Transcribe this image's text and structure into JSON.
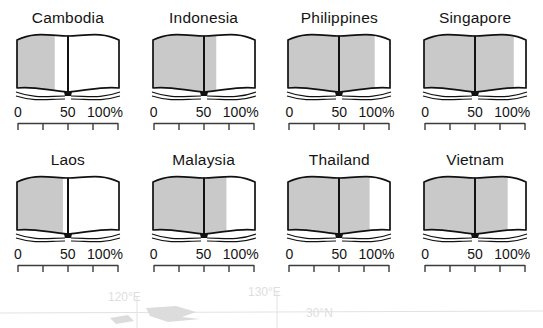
{
  "chart_data": {
    "type": "bar",
    "title": "",
    "subtitle": "",
    "xlabel": "",
    "ylabel": "",
    "xlim": [
      0,
      100
    ],
    "grid": false,
    "legend": "none",
    "unit": "%",
    "glyph": "open-book",
    "categories": [
      "Cambodia",
      "Indonesia",
      "Philippines",
      "Singapore",
      "Laos",
      "Malaysia",
      "Thailand",
      "Vietnam"
    ],
    "values": [
      37,
      62,
      85,
      88,
      45,
      72,
      80,
      82
    ],
    "series": [
      {
        "name": "Literacy rate",
        "values": [
          37,
          62,
          85,
          88,
          45,
          72,
          80,
          82
        ]
      }
    ]
  },
  "panels": [
    {
      "title": "Cambodia",
      "value": 37,
      "axis": {
        "min_label": "0",
        "mid_label": "50",
        "max_label": "100%"
      }
    },
    {
      "title": "Indonesia",
      "value": 62,
      "axis": {
        "min_label": "0",
        "mid_label": "50",
        "max_label": "100%"
      }
    },
    {
      "title": "Philippines",
      "value": 85,
      "axis": {
        "min_label": "0",
        "mid_label": "50",
        "max_label": "100%"
      }
    },
    {
      "title": "Singapore",
      "value": 88,
      "axis": {
        "min_label": "0",
        "mid_label": "50",
        "max_label": "100%"
      }
    },
    {
      "title": "Laos",
      "value": 45,
      "axis": {
        "min_label": "0",
        "mid_label": "50",
        "max_label": "100%"
      }
    },
    {
      "title": "Malaysia",
      "value": 72,
      "axis": {
        "min_label": "0",
        "mid_label": "50",
        "max_label": "100%"
      }
    },
    {
      "title": "Thailand",
      "value": 80,
      "axis": {
        "min_label": "0",
        "mid_label": "50",
        "max_label": "100%"
      }
    },
    {
      "title": "Vietnam",
      "value": 82,
      "axis": {
        "min_label": "0",
        "mid_label": "50",
        "max_label": "100%"
      }
    }
  ],
  "map_overlay": {
    "graticule_labels": [
      {
        "text": "120°E",
        "x": 108,
        "y": 297
      },
      {
        "text": "130°E",
        "x": 248,
        "y": 292
      },
      {
        "text": "30°N",
        "x": 304,
        "y": 312
      }
    ]
  },
  "colors": {
    "fill": "#c9c9c9",
    "page_white": "#ffffff",
    "outline": "#111111",
    "axis": "#3c3c3c",
    "text": "#141414",
    "map_faint": "#dedede"
  }
}
